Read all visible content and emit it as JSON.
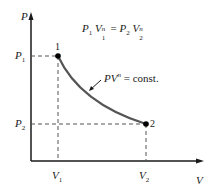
{
  "diagram": {
    "type": "P-V polytropic process",
    "axes": {
      "y_label": "P",
      "x_label": "V"
    },
    "ticks": {
      "p1": {
        "sym": "P",
        "sub": "1"
      },
      "p2": {
        "sym": "P",
        "sub": "2"
      },
      "v1": {
        "sym": "V",
        "sub": "1"
      },
      "v2": {
        "sym": "V",
        "sub": "2"
      }
    },
    "points": [
      {
        "label": "1"
      },
      {
        "label": "2"
      }
    ],
    "equation": {
      "lhs_p": "P",
      "lhs_p_sub": "1",
      "lhs_v": "V",
      "lhs_v_sup": "n",
      "lhs_v_sub": "1",
      "equals": "=",
      "rhs_p": "P",
      "rhs_p_sub": "2",
      "rhs_v": "V",
      "rhs_v_sup": "n",
      "rhs_v_sub": "2"
    },
    "curve_label": {
      "pv": "PV",
      "exp": "n",
      "rest": " = const."
    },
    "colors": {
      "axis": "#1a1a1a",
      "curve": "#555555",
      "dashes": "#555555",
      "points": "#000000"
    }
  }
}
